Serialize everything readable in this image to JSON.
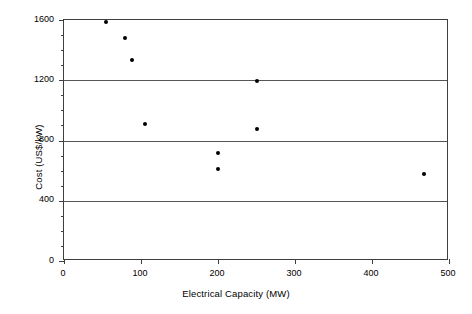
{
  "chart_data": {
    "type": "scatter",
    "title": "",
    "xlabel": "Electrical Capacity (MW)",
    "ylabel": "Cost (US$/kW)",
    "xlim": [
      0,
      500
    ],
    "ylim": [
      0,
      1600
    ],
    "xticks": [
      0,
      100,
      200,
      300,
      400,
      500
    ],
    "xtick_labels": [
      "0",
      "100",
      "200",
      "300",
      "400",
      "500"
    ],
    "yticks": [
      0,
      400,
      800,
      1200,
      1600
    ],
    "ytick_labels": [
      "0",
      "400",
      "800",
      "1200",
      "1600"
    ],
    "y_minor_tick_step": 100,
    "grid": "horizontal-major",
    "legend": null,
    "marker": "filled-circle",
    "marker_color": "#000000",
    "points": [
      {
        "x": 55,
        "y": 1585
      },
      {
        "x": 79,
        "y": 1480
      },
      {
        "x": 88,
        "y": 1335
      },
      {
        "x": 105,
        "y": 910
      },
      {
        "x": 200,
        "y": 715
      },
      {
        "x": 200,
        "y": 610
      },
      {
        "x": 250,
        "y": 1195
      },
      {
        "x": 250,
        "y": 875
      },
      {
        "x": 468,
        "y": 575
      }
    ],
    "series": [
      {
        "name": "Cost vs Electrical Capacity",
        "x": [
          55,
          79,
          88,
          105,
          200,
          200,
          250,
          250,
          468
        ],
        "values": [
          1585,
          1480,
          1335,
          910,
          715,
          610,
          1195,
          875,
          575
        ]
      }
    ]
  },
  "axis_colors": {
    "frame": "#3f3f3f",
    "gridline": "#555555",
    "marker": "#000000",
    "background": "#ffffff"
  }
}
